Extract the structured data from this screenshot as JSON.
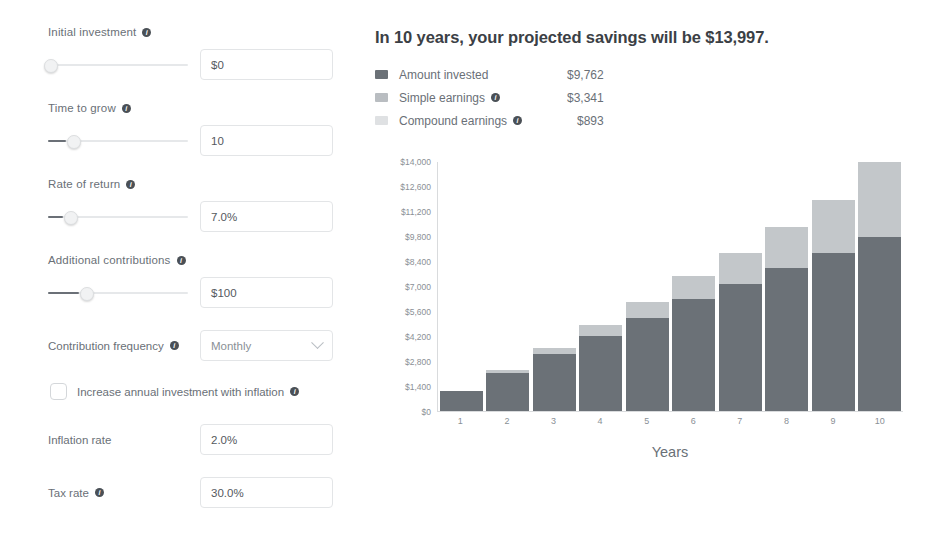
{
  "form": {
    "fields": [
      {
        "label": "Initial investment",
        "has_info": true,
        "value": "$0",
        "slider_pct": 1.5,
        "slider_fill_pct": 0
      },
      {
        "label": "Time to grow",
        "has_info": true,
        "value": "10",
        "slider_pct": 17,
        "slider_fill_pct": 12
      },
      {
        "label": "Rate of return",
        "has_info": true,
        "value": "7.0%",
        "slider_pct": 15,
        "slider_fill_pct": 10
      },
      {
        "label": "Additional contributions",
        "has_info": true,
        "value": "$100",
        "slider_pct": 26,
        "slider_fill_pct": 21
      }
    ],
    "frequency": {
      "label": "Contribution frequency",
      "has_info": true,
      "selected": "Monthly",
      "options": [
        "Monthly",
        "Annually",
        "Weekly",
        "Quarterly"
      ],
      "chevron_icon": "chevron-down-icon"
    },
    "inflation_checkbox": {
      "label": "Increase annual investment with inflation",
      "checked": false,
      "has_info": true
    },
    "inflation_rate": {
      "label": "Inflation rate",
      "has_info": false,
      "value": "2.0%"
    },
    "tax_rate": {
      "label": "Tax rate",
      "has_info": true,
      "value": "30.0%"
    }
  },
  "results": {
    "headline": "In 10 years, your projected savings will be $13,997.",
    "legend": [
      {
        "name": "Amount invested",
        "value": "$9,762",
        "color": "#6b7177",
        "has_info": false
      },
      {
        "name": "Simple earnings",
        "value": "$3,341",
        "color": "#b9bdc1",
        "has_info": true
      },
      {
        "name": "Compound earnings",
        "value": "$893",
        "color": "#dfe1e3",
        "has_info": true
      }
    ]
  },
  "chart_data": {
    "type": "bar",
    "stacked": true,
    "title": "",
    "xlabel": "Years",
    "ylabel": "",
    "categories": [
      "1",
      "2",
      "3",
      "4",
      "5",
      "6",
      "7",
      "8",
      "9",
      "10"
    ],
    "ytick_labels": [
      "$0",
      "$1,400",
      "$2,800",
      "$4,200",
      "$5,600",
      "$7,000",
      "$8,400",
      "$9,800",
      "$11,200",
      "$12,600",
      "$14,000"
    ],
    "ytick_values": [
      0,
      1400,
      2800,
      4200,
      5600,
      7000,
      8400,
      9800,
      11200,
      12600,
      14000
    ],
    "ylim": [
      0,
      14000
    ],
    "grid": false,
    "legend_position": "above-chart",
    "series": [
      {
        "name": "Amount invested",
        "color": "#6b7177",
        "values": [
          1100,
          2150,
          3180,
          4230,
          5250,
          6300,
          7150,
          8050,
          8900,
          9762
        ]
      },
      {
        "name": "Earnings",
        "color": "#c3c7ca",
        "values": [
          45,
          160,
          340,
          580,
          890,
          1270,
          1740,
          2290,
          2940,
          4235
        ]
      }
    ],
    "totals": [
      1145,
      2310,
      3520,
      4810,
      6140,
      7570,
      8890,
      10340,
      11840,
      13997
    ]
  }
}
